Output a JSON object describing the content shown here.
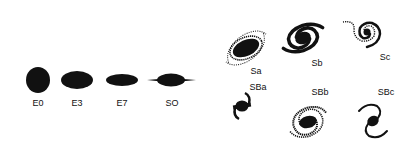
{
  "colors": {
    "ink": "#111111",
    "background": "#ffffff"
  },
  "elliptical": [
    {
      "label": "E0"
    },
    {
      "label": "E3"
    },
    {
      "label": "E7"
    },
    {
      "label": "SO"
    }
  ],
  "spiral": [
    {
      "label": "Sa"
    },
    {
      "label": "Sb"
    },
    {
      "label": "Sc"
    }
  ],
  "barred_spiral": [
    {
      "label": "SBa"
    },
    {
      "label": "SBb"
    },
    {
      "label": "SBc"
    }
  ]
}
